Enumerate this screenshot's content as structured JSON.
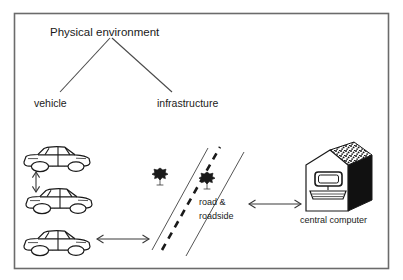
{
  "diagram": {
    "title": "Physical environment",
    "branches": [
      {
        "label": "vehicle"
      },
      {
        "label": "infrastructure"
      }
    ],
    "nodes": {
      "road_line1": "road &",
      "road_line2": "roadside",
      "central_computer": "central computer"
    },
    "icons": {
      "car": "car-icon",
      "tree": "tree-icon",
      "house": "building-icon",
      "monitor": "computer-monitor-icon",
      "keyboard": "keyboard-icon",
      "arrow_vertical": "double-arrow-vertical-icon",
      "arrow_horizontal": "double-arrow-horizontal-icon"
    },
    "colors": {
      "ink": "#1a1a1a",
      "line": "#4a4a4a",
      "border": "#6b6b6b",
      "background": "#ffffff",
      "house_side": "#111111"
    }
  }
}
